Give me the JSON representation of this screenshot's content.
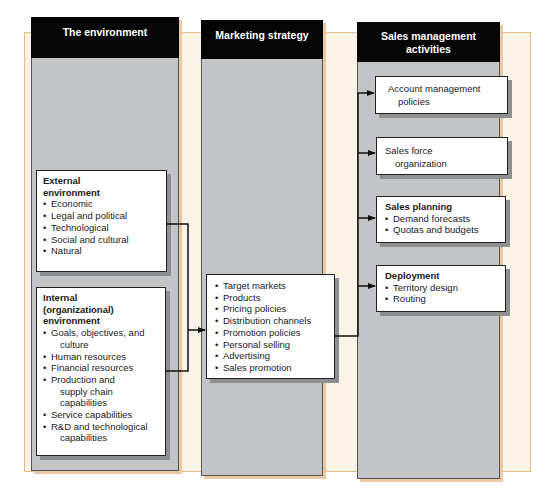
{
  "columns": [
    {
      "id": "environment",
      "header": "The environment",
      "boxes": [
        {
          "id": "external",
          "title_lines": [
            "External",
            "environment"
          ],
          "items": [
            "Economic",
            "Legal and political",
            "Technological",
            "Social and cultural",
            "Natural"
          ]
        },
        {
          "id": "internal",
          "title_lines": [
            "Internal",
            "(organizational)",
            "environment"
          ],
          "items": [
            [
              "Goals, objectives, and",
              "culture"
            ],
            [
              "Human resources"
            ],
            [
              "Financial resources"
            ],
            [
              "Production and",
              "supply chain",
              "capabilities"
            ],
            [
              "Service capabilities"
            ],
            [
              "R&D and technological",
              "capabilities"
            ]
          ]
        }
      ]
    },
    {
      "id": "marketing",
      "header": "Marketing strategy",
      "boxes": [
        {
          "id": "strategy",
          "items": [
            "Target markets",
            "Products",
            "Pricing policies",
            "Distribution channels",
            "Promotion policies",
            "Personal selling",
            "Advertising",
            "Sales promotion"
          ]
        }
      ]
    },
    {
      "id": "sales",
      "header_lines": [
        "Sales management",
        "activities"
      ],
      "boxes": [
        {
          "id": "account",
          "lines": [
            "Account management",
            "policies"
          ]
        },
        {
          "id": "salesforce",
          "lines": [
            "Sales force",
            "organization"
          ]
        },
        {
          "id": "planning",
          "title": "Sales planning",
          "items": [
            "Demand forecasts",
            "Quotas and budgets"
          ]
        },
        {
          "id": "deployment",
          "title": "Deployment",
          "items": [
            "Territory design",
            "Routing"
          ]
        }
      ]
    }
  ],
  "colors": {
    "header_bg": "#050505",
    "column_bg": "#c3c4c5",
    "band_bg": "#fbf3e6",
    "band_border": "#e9b98a",
    "box_bg": "#ffffff",
    "connector": "#111111"
  }
}
